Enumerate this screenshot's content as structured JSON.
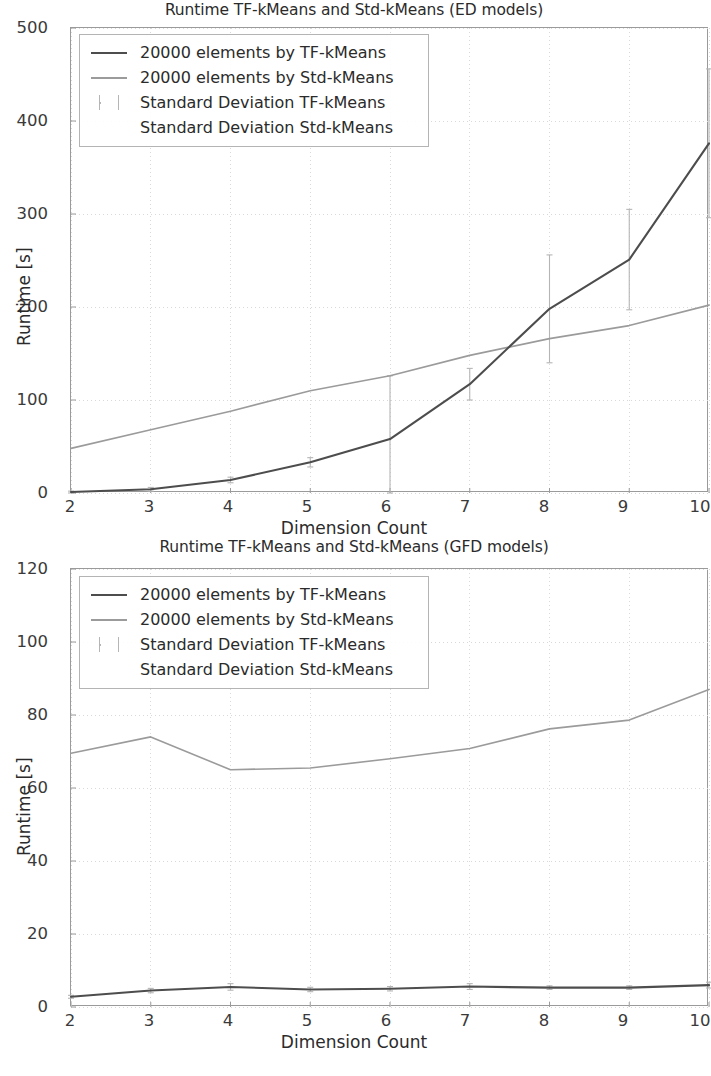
{
  "figures": [
    {
      "id": "ed",
      "title": "Runtime TF-kMeans and Std-kMeans (ED models)",
      "xlabel": "Dimension Count",
      "ylabel": "Runtime [s]",
      "legend": [
        {
          "label": "20000 elements by TF-kMeans",
          "swatch": "line-dark"
        },
        {
          "label": "20000 elements by Std-kMeans",
          "swatch": "line-gray"
        },
        {
          "label": "Standard Deviation TF-kMeans",
          "swatch": "errorbar"
        },
        {
          "label": "Standard Deviation Std-kMeans",
          "swatch": "none"
        }
      ],
      "yticks": [
        "0",
        "100",
        "200",
        "300",
        "400",
        "500"
      ],
      "xticks": [
        "2",
        "3",
        "4",
        "5",
        "6",
        "7",
        "8",
        "9",
        "10"
      ]
    },
    {
      "id": "gfd",
      "title": "Runtime TF-kMeans and Std-kMeans (GFD models)",
      "xlabel": "Dimension Count",
      "ylabel": "Runtime [s]",
      "legend": [
        {
          "label": "20000 elements by TF-kMeans",
          "swatch": "line-dark"
        },
        {
          "label": "20000 elements by Std-kMeans",
          "swatch": "line-gray"
        },
        {
          "label": "Standard Deviation TF-kMeans",
          "swatch": "errorbar"
        },
        {
          "label": "Standard Deviation Std-kMeans",
          "swatch": "none"
        }
      ],
      "yticks": [
        "0",
        "20",
        "40",
        "60",
        "80",
        "100",
        "120"
      ],
      "xticks": [
        "2",
        "3",
        "4",
        "5",
        "6",
        "7",
        "8",
        "9",
        "10"
      ]
    }
  ],
  "chart_data": [
    {
      "type": "line",
      "title": "Runtime TF-kMeans and Std-kMeans (ED models)",
      "xlabel": "Dimension Count",
      "ylabel": "Runtime [s]",
      "x": [
        2,
        3,
        4,
        5,
        6,
        7,
        8,
        9,
        10
      ],
      "xlim": [
        2,
        10
      ],
      "ylim": [
        0,
        500
      ],
      "yticks": [
        0,
        100,
        200,
        300,
        400,
        500
      ],
      "xticks": [
        2,
        3,
        4,
        5,
        6,
        7,
        8,
        9,
        10
      ],
      "grid": true,
      "legend_position": "upper left",
      "series": [
        {
          "name": "20000 elements by TF-kMeans",
          "color": "#4d4d4d",
          "values": [
            1,
            4,
            14,
            33,
            58,
            117,
            198,
            251,
            376
          ],
          "errors": [
            1,
            2,
            3,
            5,
            68,
            17,
            58,
            54,
            80
          ]
        },
        {
          "name": "20000 elements by Std-kMeans",
          "color": "#9b9b9b",
          "values": [
            48,
            68,
            88,
            110,
            126,
            148,
            166,
            180,
            202
          ],
          "errors": [
            0,
            0,
            0,
            0,
            0,
            0,
            0,
            0,
            0
          ]
        }
      ]
    },
    {
      "type": "line",
      "title": "Runtime TF-kMeans and Std-kMeans (GFD models)",
      "xlabel": "Dimension Count",
      "ylabel": "Runtime [s]",
      "x": [
        2,
        3,
        4,
        5,
        6,
        7,
        8,
        9,
        10
      ],
      "xlim": [
        2,
        10
      ],
      "ylim": [
        0,
        120
      ],
      "yticks": [
        0,
        20,
        40,
        60,
        80,
        100,
        120
      ],
      "xticks": [
        2,
        3,
        4,
        5,
        6,
        7,
        8,
        9,
        10
      ],
      "grid": true,
      "legend_position": "upper left",
      "series": [
        {
          "name": "20000 elements by TF-kMeans",
          "color": "#4d4d4d",
          "values": [
            2.8,
            4.5,
            5.5,
            4.8,
            5.0,
            5.6,
            5.3,
            5.3,
            6.0
          ],
          "errors": [
            0.4,
            0.6,
            0.9,
            0.6,
            0.6,
            0.8,
            0.5,
            0.5,
            0.8
          ]
        },
        {
          "name": "20000 elements by Std-kMeans",
          "color": "#9b9b9b",
          "values": [
            69.5,
            74.0,
            65.0,
            65.5,
            68.0,
            70.8,
            76.2,
            78.6,
            87.0
          ],
          "errors": [
            0,
            0,
            0,
            0,
            0,
            0,
            0,
            0,
            0
          ]
        }
      ]
    }
  ],
  "colors": {
    "tf_kmeans": "#4d4d4d",
    "std_kmeans": "#9b9b9b",
    "errorbar": "#b5b5b5",
    "axis": "#9a9a9a",
    "grid": "#d9d9d9",
    "text": "#2b2b2b"
  }
}
